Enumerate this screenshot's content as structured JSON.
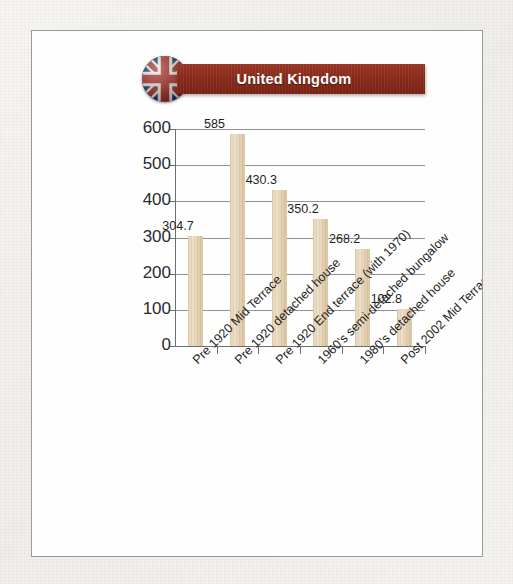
{
  "header": {
    "country_title": "United Kingdom",
    "flag_icon": "uk-flag-icon",
    "banner_color": "#8c2b1c"
  },
  "chart_data": {
    "type": "bar",
    "title": "United Kingdom",
    "xlabel": "",
    "ylabel": "",
    "ylim": [
      0,
      600
    ],
    "ytick_values": [
      600,
      500,
      400,
      300,
      200,
      100,
      0
    ],
    "ytick_labels": [
      "600",
      "500",
      "400",
      "300",
      "200",
      "100",
      "0"
    ],
    "grid": true,
    "legend": "none",
    "bar_color": "#e3cfae",
    "categories": [
      "Pre 1920 Mid Terrace",
      "Pre 1920 detached house",
      "Pre 1920 End terrace (with 1970)",
      "1960's semi-detached  bungalow",
      "1980's detached house",
      "Post 2002 Mid Terrace"
    ],
    "values": [
      304.7,
      585,
      430.3,
      350.2,
      268.2,
      102.8
    ],
    "value_labels": [
      "304.7",
      "585",
      "430.3",
      "350.2",
      "268.2",
      "102.8"
    ]
  }
}
